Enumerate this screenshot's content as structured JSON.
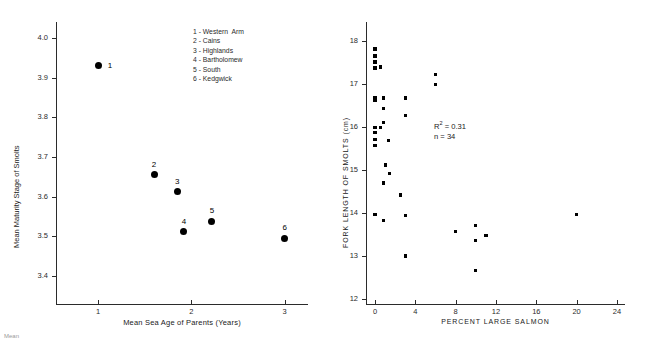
{
  "figure": {
    "caption_fragment": "Mean"
  },
  "chart_data": [
    {
      "type": "scatter",
      "id": "left",
      "title": "",
      "xlabel": "Mean Sea Age of Parents (Years)",
      "ylabel": "Mean Maturity Stage of Smolts",
      "xlim": [
        0.55,
        3.25
      ],
      "ylim": [
        3.33,
        4.04
      ],
      "xticks": [
        1,
        2,
        3
      ],
      "xticklabels": [
        "1",
        "2",
        "3"
      ],
      "yticks": [
        3.4,
        3.5,
        3.6,
        3.7,
        3.8,
        3.9,
        4.0
      ],
      "yticklabels": [
        "3.4",
        "3.5",
        "3.6",
        "3.7",
        "3.8",
        "3.9",
        "4.0"
      ],
      "grid": false,
      "marker": "filled-circle",
      "points": [
        {
          "label": "1",
          "x": 1.0,
          "y": 3.93
        },
        {
          "label": "2",
          "x": 1.6,
          "y": 3.655
        },
        {
          "label": "3",
          "x": 1.85,
          "y": 3.612
        },
        {
          "label": "4",
          "x": 1.92,
          "y": 3.512
        },
        {
          "label": "5",
          "x": 2.22,
          "y": 3.538
        },
        {
          "label": "6",
          "x": 3.0,
          "y": 3.495
        }
      ],
      "legend_position": "top-right",
      "legend": [
        "1 - Western  Arm",
        "2 - Cains",
        "3 - Highlands",
        "4 - Bartholomew",
        "5 - South",
        "6 - Kedgwick"
      ]
    },
    {
      "type": "scatter",
      "id": "right",
      "title": "",
      "xlabel": "PERCENT  LARGE  SALMON",
      "ylabel": "FORK LENGTH OF SMOLTS (cm)",
      "xlim": [
        -0.9,
        24.8
      ],
      "ylim": [
        11.88,
        18.45
      ],
      "xticks": [
        0,
        4,
        8,
        12,
        16,
        20,
        24
      ],
      "xticklabels": [
        "0",
        "4",
        "8",
        "12",
        "16",
        "20",
        "24"
      ],
      "yticks": [
        12,
        13,
        14,
        15,
        16,
        17,
        18
      ],
      "yticklabels": [
        "12",
        "13",
        "14",
        "15",
        "16",
        "17",
        "18"
      ],
      "grid": false,
      "marker": "filled-square",
      "annotations": {
        "r_squared_label": "R",
        "r_squared_exponent": "2",
        "r_squared_value": "= 0.31",
        "n_label": "n = 34"
      },
      "points": [
        {
          "x": 0.0,
          "y": 17.82
        },
        {
          "x": 0.0,
          "y": 17.66
        },
        {
          "x": 0.0,
          "y": 17.52
        },
        {
          "x": 0.0,
          "y": 17.38
        },
        {
          "x": 0.55,
          "y": 17.4
        },
        {
          "x": 6.0,
          "y": 17.22
        },
        {
          "x": 6.0,
          "y": 17.0
        },
        {
          "x": 0.0,
          "y": 16.68
        },
        {
          "x": 0.0,
          "y": 16.62
        },
        {
          "x": 0.85,
          "y": 16.68
        },
        {
          "x": 3.0,
          "y": 16.68
        },
        {
          "x": 0.85,
          "y": 16.43
        },
        {
          "x": 3.0,
          "y": 16.28
        },
        {
          "x": 0.85,
          "y": 16.1
        },
        {
          "x": 0.0,
          "y": 16.0
        },
        {
          "x": 0.55,
          "y": 16.0
        },
        {
          "x": 0.0,
          "y": 15.88
        },
        {
          "x": 0.0,
          "y": 15.72
        },
        {
          "x": 1.3,
          "y": 15.68
        },
        {
          "x": 0.0,
          "y": 15.58
        },
        {
          "x": 1.0,
          "y": 15.12
        },
        {
          "x": 1.4,
          "y": 14.92
        },
        {
          "x": 0.85,
          "y": 14.7
        },
        {
          "x": 2.5,
          "y": 14.42
        },
        {
          "x": 0.0,
          "y": 13.96
        },
        {
          "x": 3.0,
          "y": 13.94
        },
        {
          "x": 20.0,
          "y": 13.97
        },
        {
          "x": 0.85,
          "y": 13.83
        },
        {
          "x": 10.0,
          "y": 13.7
        },
        {
          "x": 8.0,
          "y": 13.57
        },
        {
          "x": 11.0,
          "y": 13.48
        },
        {
          "x": 10.0,
          "y": 13.35
        },
        {
          "x": 3.0,
          "y": 13.0
        },
        {
          "x": 10.0,
          "y": 12.66
        }
      ]
    }
  ]
}
